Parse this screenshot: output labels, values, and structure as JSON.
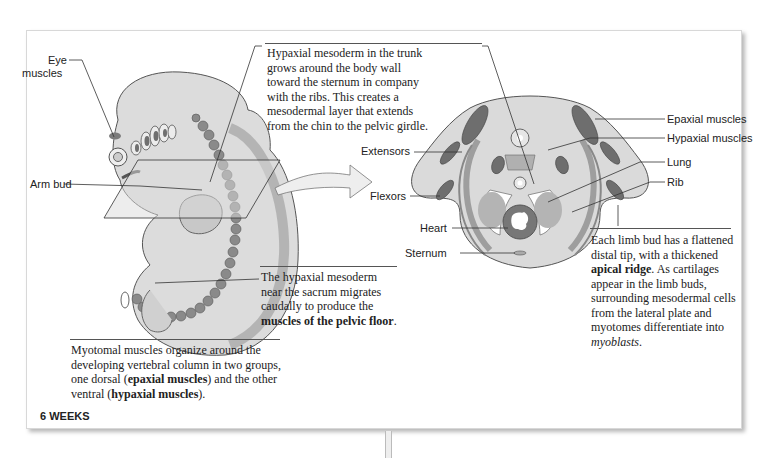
{
  "figure": {
    "stage_label": "6 WEEKS",
    "embryo_labels": {
      "eye_muscles": "Eye\nmuscles",
      "eye_line1": "Eye",
      "eye_line2": "muscles",
      "arm_bud": "Arm bud"
    },
    "section_labels": {
      "extensors": "Extensors",
      "flexors": "Flexors",
      "heart": "Heart",
      "sternum": "Sternum",
      "epaxial_muscles": "Epaxial muscles",
      "hypaxial_muscles": "Hypaxial muscles",
      "lung": "Lung",
      "rib": "Rib"
    },
    "captions": {
      "trunk": {
        "lines": [
          "Hypaxial mesoderm in the trunk",
          "grows around the body wall",
          "toward the sternum in company",
          "with the ribs. This creates a",
          "mesodermal layer that extends",
          "from the chin to the pelvic girdle."
        ]
      },
      "sacrum": {
        "lines": [
          "The hypaxial mesoderm",
          "near the sacrum migrates",
          "caudally to produce the"
        ],
        "bold": "muscles of the pelvic floor",
        "tail": "."
      },
      "myotomal": {
        "line1": "Myotomal muscles organize around the",
        "line2": "developing vertebral column in two groups,",
        "line3_a": "one dorsal (",
        "line3_bold": "epaxial muscles",
        "line3_b": ") and the other",
        "line4_a": "ventral (",
        "line4_bold": "hypaxial muscles",
        "line4_b": ")."
      },
      "limb_bud": {
        "line1": "Each limb bud has a flattened",
        "line2": "distal tip, with a thickened",
        "line3_bold": "apical ridge",
        "line3_b": ". As cartilages",
        "line4": "appear in the limb buds,",
        "line5": "surrounding mesodermal cells",
        "line6": "from the lateral plate and",
        "line7_a": "myotomes differentiate into",
        "line8_italic": "myoblasts",
        "line8_b": "."
      }
    },
    "colors": {
      "tissue_light": "#d4d4d4",
      "tissue_mid": "#b0b0b0",
      "muscle_dark": "#6e6e6e",
      "outline": "#444444"
    }
  }
}
